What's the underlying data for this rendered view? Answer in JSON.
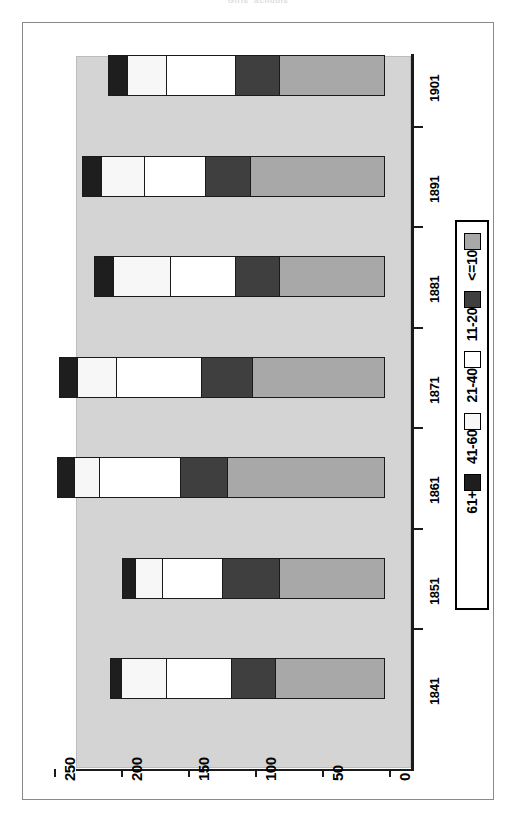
{
  "title": "Girls' Schools",
  "chart_data": {
    "type": "bar",
    "orientation": "rotated-horizontal",
    "title": "Girls' Schools",
    "xlabel": "",
    "ylabel": "",
    "categories": [
      "1841",
      "1851",
      "1861",
      "1871",
      "1881",
      "1891",
      "1901"
    ],
    "series": [
      {
        "name": "<=10",
        "color": "#a8a8a8",
        "values": [
          82,
          79,
          118,
          99,
          79,
          101,
          79
        ]
      },
      {
        "name": "11-20",
        "color": "#3f3f3f",
        "values": [
          34,
          43,
          36,
          39,
          34,
          34,
          34
        ]
      },
      {
        "name": "21-40",
        "color": "#ffffff",
        "values": [
          49,
          46,
          61,
          64,
          49,
          46,
          52
        ]
      },
      {
        "name": "41-60",
        "color": "#f7f7f7",
        "values": [
          34,
          21,
          19,
          30,
          43,
          33,
          30
        ]
      },
      {
        "name": "61+",
        "color": "#1e1e1e",
        "values": [
          9,
          10,
          14,
          14,
          15,
          15,
          15
        ]
      }
    ],
    "totals": [
      208,
      199,
      248,
      246,
      220,
      229,
      210
    ],
    "value_axis": {
      "ticks": [
        "250",
        "200",
        "150",
        "100",
        "50",
        "0"
      ],
      "min": 0,
      "max": 250,
      "reversed": true
    },
    "grid": false,
    "legend": {
      "position": "right",
      "entries": [
        {
          "label": "<=10",
          "color": "#a8a8a8"
        },
        {
          "label": "11-20",
          "color": "#3f3f3f"
        },
        {
          "label": "21-40",
          "color": "#ffffff"
        },
        {
          "label": "41-60",
          "color": "#f7f7f7"
        },
        {
          "label": "61+",
          "color": "#1e1e1e"
        }
      ]
    },
    "plot_background": "#d4d4d4"
  }
}
